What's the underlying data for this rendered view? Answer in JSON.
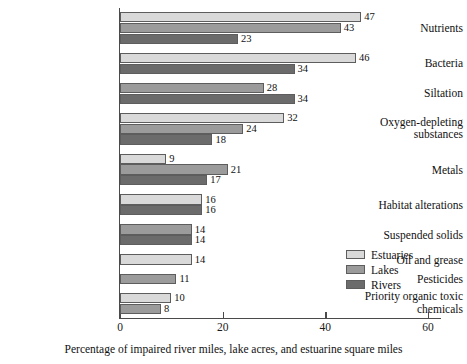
{
  "chart_data": {
    "type": "bar",
    "orientation": "horizontal",
    "title": "",
    "subtitle": "",
    "xlabel": "Percentage of impaired river miles, lake acres, and estuarine square miles",
    "ylabel": "",
    "xlim": [
      0,
      63
    ],
    "xticks": [
      0,
      20,
      40,
      60
    ],
    "xtick_labels": [
      "0",
      "20",
      "40",
      "60"
    ],
    "grid": false,
    "legend_position": "inside-right",
    "categories": [
      "Nutrients",
      "Bacteria",
      "Siltation",
      "Oxygen-depleting substances",
      "Metals",
      "Habitat alterations",
      "Suspended solids",
      "Oil and grease",
      "Pesticides",
      "Priority organic toxic chemicals"
    ],
    "series": [
      {
        "name": "Estuaries",
        "color": "#d9d9d9",
        "values": [
          47,
          46,
          null,
          32,
          9,
          16,
          null,
          14,
          null,
          10
        ]
      },
      {
        "name": "Lakes",
        "color": "#9b9b9b",
        "values": [
          43,
          null,
          28,
          24,
          21,
          null,
          14,
          null,
          11,
          8
        ]
      },
      {
        "name": "Rivers",
        "color": "#6b6b6b",
        "values": [
          23,
          34,
          34,
          18,
          17,
          16,
          14,
          null,
          null,
          null
        ]
      }
    ],
    "data_labels": [
      {
        "category": "Nutrients",
        "series": "Estuaries",
        "value": 47,
        "label": "47"
      },
      {
        "category": "Nutrients",
        "series": "Lakes",
        "value": 43,
        "label": "43"
      },
      {
        "category": "Nutrients",
        "series": "Rivers",
        "value": 23,
        "label": "23"
      },
      {
        "category": "Bacteria",
        "series": "Estuaries",
        "value": 46,
        "label": "46"
      },
      {
        "category": "Bacteria",
        "series": "Rivers",
        "value": 34,
        "label": "34"
      },
      {
        "category": "Siltation",
        "series": "Lakes",
        "value": 28,
        "label": "28"
      },
      {
        "category": "Siltation",
        "series": "Rivers",
        "value": 34,
        "label": "34"
      },
      {
        "category": "Oxygen-depleting substances",
        "series": "Estuaries",
        "value": 32,
        "label": "32"
      },
      {
        "category": "Oxygen-depleting substances",
        "series": "Lakes",
        "value": 24,
        "label": "24"
      },
      {
        "category": "Oxygen-depleting substances",
        "series": "Rivers",
        "value": 18,
        "label": "18"
      },
      {
        "category": "Metals",
        "series": "Estuaries",
        "value": 9,
        "label": "9"
      },
      {
        "category": "Metals",
        "series": "Lakes",
        "value": 21,
        "label": "21"
      },
      {
        "category": "Metals",
        "series": "Rivers",
        "value": 17,
        "label": "17"
      },
      {
        "category": "Habitat alterations",
        "series": "Estuaries",
        "value": 16,
        "label": "16"
      },
      {
        "category": "Habitat alterations",
        "series": "Rivers",
        "value": 16,
        "label": "16"
      },
      {
        "category": "Suspended solids",
        "series": "Lakes",
        "value": 14,
        "label": "14"
      },
      {
        "category": "Suspended solids",
        "series": "Rivers",
        "value": 14,
        "label": "14"
      },
      {
        "category": "Oil and grease",
        "series": "Estuaries",
        "value": 14,
        "label": "14"
      },
      {
        "category": "Pesticides",
        "series": "Lakes",
        "value": 11,
        "label": "11"
      },
      {
        "category": "Priority organic toxic chemicals",
        "series": "Estuaries",
        "value": 10,
        "label": "10"
      },
      {
        "category": "Priority organic toxic chemicals",
        "series": "Lakes",
        "value": 8,
        "label": "8"
      }
    ]
  },
  "category_label_lines": [
    [
      "Nutrients"
    ],
    [
      "Bacteria"
    ],
    [
      "Siltation"
    ],
    [
      "Oxygen-depleting",
      "substances"
    ],
    [
      "Metals"
    ],
    [
      "Habitat alterations"
    ],
    [
      "Suspended solids"
    ],
    [
      "Oil and grease"
    ],
    [
      "Pesticides"
    ],
    [
      "Priority organic toxic",
      "chemicals"
    ]
  ],
  "legend": {
    "items": [
      {
        "label": "Estuaries",
        "color": "#d9d9d9"
      },
      {
        "label": "Lakes",
        "color": "#9b9b9b"
      },
      {
        "label": "Rivers",
        "color": "#6b6b6b"
      }
    ]
  },
  "axis": {
    "x_caption": "Percentage of impaired river miles, lake acres, and estuarine square miles",
    "tick_labels": [
      "0",
      "20",
      "40",
      "60"
    ],
    "tick_values": [
      0,
      20,
      40,
      60
    ]
  },
  "colors": {
    "estuaries": "#d9d9d9",
    "lakes": "#9b9b9b",
    "rivers": "#6b6b6b",
    "axis": "#4a4a4a",
    "text": "#111111",
    "background": "#ffffff"
  }
}
